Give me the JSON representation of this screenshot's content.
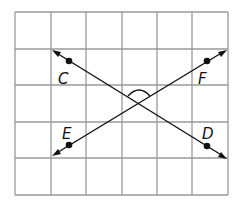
{
  "diagram": {
    "type": "intersecting-lines-on-grid",
    "grid": {
      "columns": 6,
      "rows": 5,
      "line_color": "#9a9a9a"
    },
    "line_color": "#111111",
    "lines": [
      {
        "name": "line-CD",
        "through": [
          "C",
          "D"
        ],
        "arrows": "both"
      },
      {
        "name": "line-EF",
        "through": [
          "E",
          "F"
        ],
        "arrows": "both"
      }
    ],
    "points": [
      {
        "label": "C"
      },
      {
        "label": "F"
      },
      {
        "label": "E"
      },
      {
        "label": "D"
      }
    ],
    "angle_marked": "angle between the lines above the intersection"
  }
}
